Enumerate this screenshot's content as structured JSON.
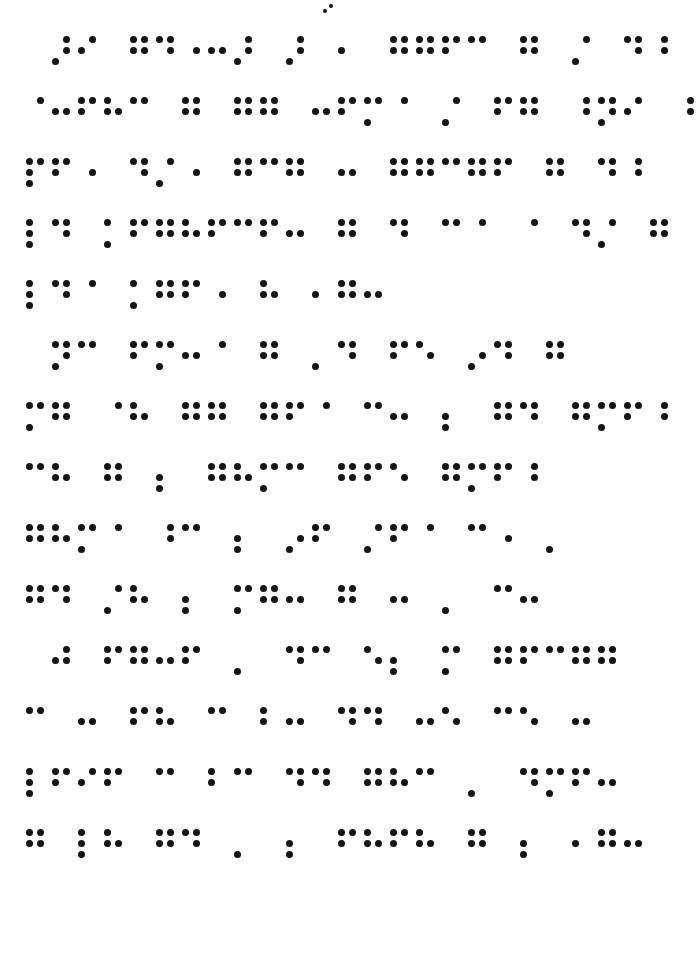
{
  "document": {
    "type": "braille-page",
    "script": "Braille",
    "ink_color": "#141414",
    "page_color": "#ffffff",
    "line_count": 14,
    "paragraph_count": 3,
    "cells_per_line_max": 26,
    "metrics": {
      "left_margin_px": 25,
      "first_line_top_px": 36,
      "line_pitch_px": 61,
      "cell_pitch_px": 26,
      "dot_pitch_x_px": 11,
      "dot_pitch_y_px": 11,
      "dot_diameter_px": 7,
      "paragraph_indent_cells": 1
    }
  },
  "page_number": {
    "visible": true,
    "position": "top-center",
    "cells": [
      [
        2,
        4
      ]
    ]
  },
  "lines": [
    {
      "index": 1,
      "top": 36,
      "indent_cells": 1,
      "paragraph_start": true,
      "cells": [
        [
          3,
          4,
          5
        ],
        [
          2,
          4
        ],
        [
          0
        ],
        [
          1,
          2,
          4,
          5
        ],
        [
          1,
          4,
          5
        ],
        [
          5
        ],
        [
          2,
          5
        ],
        [
          3,
          4,
          5
        ],
        [
          0
        ],
        [
          3,
          4,
          5
        ],
        [
          0
        ],
        [
          2
        ],
        [
          0
        ],
        [
          1,
          2,
          4,
          5
        ],
        [
          1,
          2,
          4,
          5
        ],
        [
          1,
          2,
          4
        ],
        [
          1,
          4
        ],
        [
          0
        ],
        [
          1,
          2,
          4,
          5
        ],
        [
          0
        ],
        [
          3,
          4
        ],
        [
          0
        ],
        [
          1,
          4,
          5
        ],
        [
          4,
          5
        ]
      ]
    },
    {
      "index": 2,
      "top": 97,
      "indent_cells": 0,
      "paragraph_start": false,
      "cells": [
        [
          4
        ],
        [
          2,
          5
        ],
        [
          1,
          2,
          4
        ],
        [
          1,
          2,
          5
        ],
        [
          1,
          4
        ],
        [
          0
        ],
        [
          1,
          2,
          4,
          5
        ],
        [
          0
        ],
        [
          1,
          2,
          4,
          5
        ],
        [
          1,
          2,
          4,
          5
        ],
        [
          0
        ],
        [
          2,
          5
        ],
        [
          1,
          2,
          4
        ],
        [
          1,
          3,
          4
        ],
        [
          4
        ],
        [
          0
        ],
        [
          3,
          4
        ],
        [
          0
        ],
        [
          1,
          2,
          4
        ],
        [
          1,
          2,
          4,
          5
        ],
        [
          0
        ],
        [
          4,
          5
        ],
        [
          1,
          3,
          4,
          5
        ],
        [
          2,
          4
        ],
        [
          0
        ],
        [
          4,
          5
        ]
      ]
    },
    {
      "index": 3,
      "top": 158,
      "indent_cells": 0,
      "paragraph_start": false,
      "cells": [
        [
          1,
          2,
          3,
          4
        ],
        [
          1,
          2,
          4
        ],
        [
          5
        ],
        [
          0
        ],
        [
          1,
          4,
          5
        ],
        [
          3,
          4
        ],
        [
          5
        ],
        [
          0
        ],
        [
          1,
          2,
          4,
          5
        ],
        [
          1,
          4
        ],
        [
          1,
          2,
          4,
          5
        ],
        [
          0
        ],
        [
          2,
          5
        ],
        [
          0
        ],
        [
          1,
          2,
          4,
          5
        ],
        [
          1,
          2,
          4,
          5
        ],
        [
          1,
          4
        ],
        [
          1,
          2,
          4,
          5
        ],
        [
          1,
          2,
          4
        ],
        [
          0
        ],
        [
          1,
          2,
          4,
          5
        ],
        [
          0
        ],
        [
          1,
          4,
          5
        ],
        [
          4,
          5
        ]
      ]
    },
    {
      "index": 4,
      "top": 219,
      "indent_cells": 0,
      "paragraph_start": false,
      "cells": [
        [
          1,
          2,
          3
        ],
        [
          1,
          4,
          5
        ],
        [
          0
        ],
        [
          1,
          3
        ],
        [
          1,
          2,
          4
        ],
        [
          1,
          2,
          4,
          5
        ],
        [
          1,
          2,
          5
        ],
        [
          1,
          2,
          4
        ],
        [
          1,
          4
        ],
        [
          1,
          2,
          4
        ],
        [
          2,
          5
        ],
        [
          0
        ],
        [
          1,
          2,
          4,
          5
        ],
        [
          0
        ],
        [
          1,
          4,
          5
        ],
        [
          0
        ],
        [
          1,
          4
        ],
        [
          4
        ],
        [
          0
        ],
        [
          4
        ],
        [
          0
        ],
        [
          1,
          4,
          5
        ],
        [
          3,
          4
        ],
        [
          0
        ],
        [
          1,
          2,
          4,
          5
        ]
      ]
    },
    {
      "index": 5,
      "top": 280,
      "indent_cells": 0,
      "paragraph_start": false,
      "cells": [
        [
          1,
          2,
          3
        ],
        [
          1,
          4,
          5
        ],
        [
          4
        ],
        [
          0
        ],
        [
          1,
          3
        ],
        [
          1,
          2,
          4,
          5
        ],
        [
          1,
          2,
          4
        ],
        [
          5
        ],
        [
          0
        ],
        [
          1,
          2,
          5
        ],
        [
          0
        ],
        [
          2
        ],
        [
          1,
          2,
          4,
          5
        ],
        [
          2,
          5
        ]
      ]
    },
    {
      "index": 6,
      "top": 341,
      "indent_cells": 1,
      "paragraph_start": true,
      "cells": [
        [
          1,
          3,
          4,
          5
        ],
        [
          1,
          4
        ],
        [
          0
        ],
        [
          1,
          2,
          4
        ],
        [
          1,
          3,
          4
        ],
        [
          2,
          5
        ],
        [
          4
        ],
        [
          0
        ],
        [
          1,
          2,
          4,
          5
        ],
        [
          0
        ],
        [
          3
        ],
        [
          1,
          4,
          5
        ],
        [
          0
        ],
        [
          1,
          2,
          4
        ],
        [
          1,
          5
        ],
        [
          0
        ],
        [
          3,
          5
        ],
        [
          1,
          4,
          5
        ],
        [
          0
        ],
        [
          1,
          2,
          4,
          5
        ]
      ]
    },
    {
      "index": 7,
      "top": 402,
      "indent_cells": 0,
      "paragraph_start": false,
      "cells": [
        [
          1,
          3,
          4
        ],
        [
          1,
          2,
          4,
          5
        ],
        [
          0
        ],
        [
          4
        ],
        [
          1,
          2,
          5
        ],
        [
          0
        ],
        [
          1,
          2,
          4,
          5
        ],
        [
          1,
          2,
          4,
          5
        ],
        [
          0
        ],
        [
          1,
          2,
          4,
          5
        ],
        [
          1,
          2,
          4
        ],
        [
          4
        ],
        [
          0
        ],
        [
          1,
          4
        ],
        [
          2,
          5
        ],
        [
          0
        ],
        [
          2,
          3
        ],
        [
          0
        ],
        [
          1,
          2,
          4,
          5
        ],
        [
          1,
          4,
          5
        ],
        [
          0
        ],
        [
          1,
          2,
          4,
          5
        ],
        [
          1,
          3,
          4
        ],
        [
          1,
          2,
          4
        ],
        [
          4,
          5
        ]
      ]
    },
    {
      "index": 8,
      "top": 463,
      "indent_cells": 0,
      "paragraph_start": false,
      "cells": [
        [
          1,
          4
        ],
        [
          1,
          2,
          5
        ],
        [
          0
        ],
        [
          1,
          2,
          4,
          5
        ],
        [
          0
        ],
        [
          2,
          3
        ],
        [
          0
        ],
        [
          1,
          2,
          4,
          5
        ],
        [
          1,
          2,
          5
        ],
        [
          1,
          3,
          4
        ],
        [
          1,
          4
        ],
        [
          0
        ],
        [
          1,
          2,
          4,
          5
        ],
        [
          1,
          2,
          4
        ],
        [
          1,
          5
        ],
        [
          0
        ],
        [
          1,
          2,
          4,
          5
        ],
        [
          1,
          3,
          4
        ],
        [
          1,
          2,
          4
        ],
        [
          4,
          5
        ]
      ]
    },
    {
      "index": 9,
      "top": 524,
      "indent_cells": 0,
      "paragraph_start": false,
      "cells": [
        [
          1,
          2,
          4,
          5
        ],
        [
          1,
          2,
          5
        ],
        [
          1,
          3,
          4
        ],
        [
          4
        ],
        [
          0
        ],
        [
          4,
          5
        ],
        [
          1,
          4
        ],
        [
          0
        ],
        [
          2,
          3
        ],
        [
          0
        ],
        [
          3,
          5
        ],
        [
          1,
          2,
          4
        ],
        [
          0
        ],
        [
          3,
          4
        ],
        [
          1,
          2,
          4
        ],
        [
          4
        ],
        [
          0
        ],
        [
          1,
          4
        ],
        [
          5
        ],
        [
          0
        ],
        [
          3
        ]
      ]
    },
    {
      "index": 10,
      "top": 585,
      "indent_cells": 0,
      "paragraph_start": false,
      "cells": [
        [
          1,
          2,
          4,
          5
        ],
        [
          1,
          4,
          5
        ],
        [
          0
        ],
        [
          3,
          4
        ],
        [
          1,
          2,
          5
        ],
        [
          0
        ],
        [
          2,
          3
        ],
        [
          0
        ],
        [
          1,
          3,
          4
        ],
        [
          1,
          2,
          4,
          5
        ],
        [
          2,
          5
        ],
        [
          0
        ],
        [
          1,
          2,
          4,
          5
        ],
        [
          0
        ],
        [
          2,
          5
        ],
        [
          0
        ],
        [
          3
        ],
        [
          0
        ],
        [
          1,
          4
        ],
        [
          2,
          5
        ]
      ]
    },
    {
      "index": 11,
      "top": 646,
      "indent_cells": 1,
      "paragraph_start": true,
      "cells": [
        [
          2,
          4,
          5
        ],
        [
          0
        ],
        [
          1,
          2,
          4
        ],
        [
          1,
          2,
          4,
          5
        ],
        [
          2,
          5
        ],
        [
          1,
          2,
          4
        ],
        [
          0
        ],
        [
          3
        ],
        [
          0
        ],
        [
          1,
          4,
          5
        ],
        [
          1,
          4
        ],
        [
          0
        ],
        [
          1,
          5
        ],
        [
          2,
          3
        ],
        [
          0
        ],
        [
          1,
          3,
          4
        ],
        [
          0
        ],
        [
          1,
          2,
          4,
          5
        ],
        [
          1,
          2,
          4
        ],
        [
          1,
          4
        ],
        [
          1,
          2,
          4,
          5
        ],
        [
          1,
          2,
          4,
          5
        ]
      ]
    },
    {
      "index": 12,
      "top": 707,
      "indent_cells": 0,
      "paragraph_start": false,
      "cells": [
        [
          1,
          4
        ],
        [
          0
        ],
        [
          2,
          5
        ],
        [
          0
        ],
        [
          1,
          2,
          4
        ],
        [
          1,
          2,
          5
        ],
        [
          0
        ],
        [
          1,
          4
        ],
        [
          0
        ],
        [
          1,
          2
        ],
        [
          2,
          5
        ],
        [
          0
        ],
        [
          1,
          4,
          5
        ],
        [
          1,
          4,
          5
        ],
        [
          0
        ],
        [
          2,
          5
        ],
        [
          1,
          5
        ],
        [
          0
        ],
        [
          1,
          4
        ],
        [
          1,
          5
        ],
        [
          0
        ],
        [
          2,
          5
        ]
      ]
    },
    {
      "index": 13,
      "top": 768,
      "indent_cells": 0,
      "paragraph_start": false,
      "cells": [
        [
          1,
          2,
          3
        ],
        [
          1,
          2,
          4
        ],
        [
          2,
          4
        ],
        [
          1,
          2,
          4
        ],
        [
          0
        ],
        [
          1,
          4
        ],
        [
          0
        ],
        [
          1,
          2
        ],
        [
          1,
          4
        ],
        [
          0
        ],
        [
          1,
          4,
          5
        ],
        [
          1,
          4,
          5
        ],
        [
          0
        ],
        [
          1,
          2,
          4,
          5
        ],
        [
          1,
          2,
          5
        ],
        [
          1,
          4
        ],
        [
          0
        ],
        [
          3
        ],
        [
          0
        ],
        [
          1,
          4,
          5
        ],
        [
          1,
          3,
          4
        ],
        [
          1,
          2,
          4
        ],
        [
          2,
          5
        ]
      ]
    },
    {
      "index": 14,
      "top": 829,
      "indent_cells": 0,
      "paragraph_start": false,
      "cells": [
        [
          1,
          2,
          4,
          5
        ],
        [
          0
        ],
        [
          1,
          2,
          3
        ],
        [
          1,
          2,
          5
        ],
        [
          0
        ],
        [
          1,
          2,
          4,
          5
        ],
        [
          1,
          4,
          5
        ],
        [
          0
        ],
        [
          3
        ],
        [
          0
        ],
        [
          2,
          3
        ],
        [
          0
        ],
        [
          1,
          2,
          4
        ],
        [
          1,
          2,
          5
        ],
        [
          1,
          2,
          4
        ],
        [
          1,
          2,
          5
        ],
        [
          0
        ],
        [
          1,
          2,
          4,
          5
        ],
        [
          0
        ],
        [
          2,
          3
        ],
        [
          0
        ],
        [
          2
        ],
        [
          1,
          2,
          4,
          5
        ],
        [
          2,
          5
        ]
      ]
    }
  ]
}
